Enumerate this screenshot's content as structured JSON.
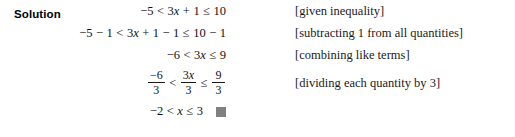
{
  "block": {
    "label": "Solution"
  },
  "qed": {
    "symbol": "",
    "color": "#808080"
  },
  "steps": [
    {
      "id": "step-1",
      "math_text": "−5 < 3x + 1 ≤ 10",
      "tokens": {
        "t1": "−5",
        "op1": "<",
        "t2": "3",
        "var1": "x",
        "op2": "+",
        "t3": "1",
        "op3": "≤",
        "t4": "10"
      },
      "note": "[given inequality]"
    },
    {
      "id": "step-2",
      "math_text": "−5 − 1 < 3x + 1 − 1 ≤ 10 − 1",
      "tokens": {
        "t1": "−5",
        "op0": "−",
        "t0": "1",
        "op1": "<",
        "t2": "3",
        "var1": "x",
        "op2": "+",
        "t3": "1",
        "op2b": "−",
        "t3b": "1",
        "op3": "≤",
        "t4": "10",
        "op4": "−",
        "t5": "1"
      },
      "note": "[subtracting 1 from all quantities]"
    },
    {
      "id": "step-3",
      "math_text": "−6 < 3x ≤ 9",
      "tokens": {
        "t1": "−6",
        "op1": "<",
        "t2": "3",
        "var1": "x",
        "op3": "≤",
        "t4": "9"
      },
      "note": "[combining like terms]"
    },
    {
      "id": "step-4",
      "math_text": "−6/3 < 3x/3 ≤ 9/3",
      "fractions": {
        "f1_num": "−6",
        "f1_den": "3",
        "op1": "<",
        "f2_num_coeff": "3",
        "f2_num_var": "x",
        "f2_den": "3",
        "op2": "≤",
        "f3_num": "9",
        "f3_den": "3"
      },
      "note": "[dividing each quantity by 3]"
    },
    {
      "id": "step-5",
      "math_text": "−2 < x ≤ 3",
      "tokens": {
        "t1": "−2",
        "op1": "<",
        "var1": "x",
        "op3": "≤",
        "t4": "3"
      },
      "note": ""
    }
  ]
}
